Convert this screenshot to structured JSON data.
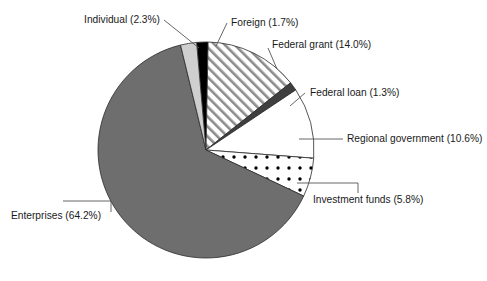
{
  "chart_data": {
    "type": "pie",
    "title": "",
    "subtitle": "",
    "xlabel": "",
    "ylabel": "",
    "legend_position": "none",
    "grid": false,
    "labels_show_percent": true,
    "total_percent": 99.9,
    "categories": [
      "Foreign",
      "Federal grant",
      "Federal loan",
      "Regional government",
      "Investment funds",
      "Enterprises",
      "Individual"
    ],
    "values": [
      1.7,
      14.0,
      1.3,
      10.6,
      5.8,
      64.2,
      2.3
    ],
    "slices": [
      {
        "label": "Foreign",
        "value": 1.7,
        "label_text": "Foreign (1.7%)",
        "fill": "#000000",
        "pattern": "solid",
        "start_angle": -5.0,
        "end_angle": 1.12
      },
      {
        "label": "Federal grant",
        "value": 14.0,
        "label_text": "Federal grant (14.0%)",
        "fill": "#ffffff",
        "pattern": "diagonal-hatch",
        "start_angle": 1.12,
        "end_angle": 51.52
      },
      {
        "label": "Federal loan",
        "value": 1.3,
        "label_text": "Federal loan (1.3%)",
        "fill": "#3f3f3f",
        "pattern": "solid",
        "start_angle": 51.52,
        "end_angle": 56.2
      },
      {
        "label": "Regional government",
        "value": 10.6,
        "label_text": "Regional government (10.6%)",
        "fill": "#ffffff",
        "pattern": "solid",
        "start_angle": 56.2,
        "end_angle": 94.36
      },
      {
        "label": "Investment funds",
        "value": 5.8,
        "label_text": "Investment funds (5.8%)",
        "fill": "#ffffff",
        "pattern": "dots",
        "start_angle": 94.36,
        "end_angle": 115.24
      },
      {
        "label": "Enterprises",
        "value": 64.2,
        "label_text": "Enterprises (64.2%)",
        "fill": "#6e6e6e",
        "pattern": "solid",
        "start_angle": 115.24,
        "end_angle": 346.36
      },
      {
        "label": "Individual",
        "value": 2.3,
        "label_text": "Individual (2.3%)",
        "fill": "#cfcfcf",
        "pattern": "solid",
        "start_angle": 346.36,
        "end_angle": 355.0
      }
    ],
    "colors": {
      "foreign": "#000000",
      "federal_grant": "#ffffff",
      "federal_grant_hatch": "#8a8a8a",
      "federal_loan": "#3f3f3f",
      "regional_government": "#ffffff",
      "investment_funds": "#ffffff",
      "investment_funds_dots": "#000000",
      "enterprises": "#6e6e6e",
      "individual": "#cfcfcf",
      "outline": "#2b2b2b",
      "leader_line": "#555555",
      "text": "#1a1a1a",
      "background": "#ffffff"
    },
    "geometry": {
      "center_x": 206,
      "center_y": 150,
      "radius": 108
    }
  },
  "labels": {
    "individual": "Individual (2.3%)",
    "foreign": "Foreign (1.7%)",
    "federal_grant": "Federal grant (14.0%)",
    "federal_loan": "Federal loan (1.3%)",
    "regional_government": "Regional government (10.6%)",
    "investment_funds": "Investment funds (5.8%)",
    "enterprises": "Enterprises (64.2%)"
  }
}
